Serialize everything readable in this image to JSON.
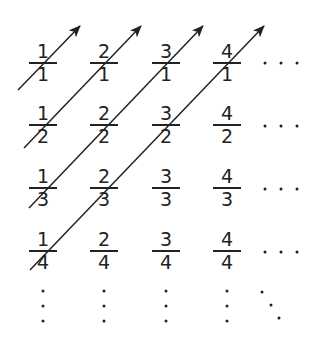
{
  "diagram": {
    "grid": [
      [
        {
          "num": "1",
          "den": "1"
        },
        {
          "num": "2",
          "den": "1"
        },
        {
          "num": "3",
          "den": "1"
        },
        {
          "num": "4",
          "den": "1"
        }
      ],
      [
        {
          "num": "1",
          "den": "2"
        },
        {
          "num": "2",
          "den": "2"
        },
        {
          "num": "3",
          "den": "2"
        },
        {
          "num": "4",
          "den": "2"
        }
      ],
      [
        {
          "num": "1",
          "den": "3"
        },
        {
          "num": "2",
          "den": "3"
        },
        {
          "num": "3",
          "den": "3"
        },
        {
          "num": "4",
          "den": "3"
        }
      ],
      [
        {
          "num": "1",
          "den": "4"
        },
        {
          "num": "2",
          "den": "4"
        },
        {
          "num": "3",
          "den": "4"
        },
        {
          "num": "4",
          "den": "4"
        }
      ]
    ],
    "row_continuation": "horizontal-ellipsis",
    "column_continuation": "vertical-ellipsis",
    "diagonal_continuation": "diagonal-ellipsis",
    "arrows": [
      {
        "label": "diagonal-1",
        "from": [
          18,
          90
        ],
        "to": [
          80,
          26
        ]
      },
      {
        "label": "diagonal-2",
        "from": [
          24,
          148
        ],
        "to": [
          141,
          26
        ]
      },
      {
        "label": "diagonal-3",
        "from": [
          29,
          208
        ],
        "to": [
          203,
          26
        ]
      },
      {
        "label": "diagonal-4",
        "from": [
          30,
          270
        ],
        "to": [
          264,
          26
        ]
      }
    ],
    "colors": {
      "ink": "#222222",
      "background": "#ffffff"
    }
  }
}
